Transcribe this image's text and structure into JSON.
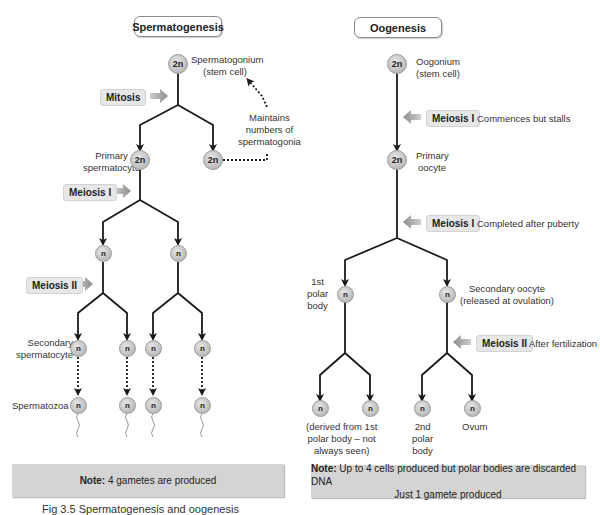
{
  "spermatogenesis": {
    "title": "Spermatogenesis",
    "stem_cell": {
      "ploidy": "2n",
      "label_line1": "Spermatogonium",
      "label_line2": "(stem cell)"
    },
    "mitosis_label": "Mitosis",
    "primary": {
      "ploidy": "2n",
      "label_line1": "Primary",
      "label_line2": "spermatocyte"
    },
    "renewed_stem_cell": {
      "ploidy": "2n"
    },
    "maintains_note": {
      "line1": "Maintains",
      "line2": "numbers of",
      "line3": "spermatogonia"
    },
    "meiosis1_label": "Meiosis I",
    "after_meiosis1": [
      "n",
      "n"
    ],
    "meiosis2_label": "Meiosis II",
    "secondary": {
      "label_line1": "Secondary",
      "label_line2": "spermatocyte",
      "cells": [
        "n",
        "n",
        "n",
        "n"
      ]
    },
    "spermatozoa": {
      "label": "Spermatozoa",
      "cells": [
        "n",
        "n",
        "n",
        "n"
      ]
    },
    "note": {
      "prefix": "Note:",
      "text": " 4 gametes are produced"
    }
  },
  "oogenesis": {
    "title": "Oogenesis",
    "stem_cell": {
      "ploidy": "2n",
      "label_line1": "Oogonium",
      "label_line2": "(stem cell)"
    },
    "meiosis1_stall": {
      "label": "Meiosis I",
      "desc": "Commences but stalls"
    },
    "primary": {
      "ploidy": "2n",
      "label_line1": "Primary",
      "label_line2": "oocyte"
    },
    "meiosis1_complete": {
      "label": "Meiosis I",
      "desc": "Completed after puberty"
    },
    "first_polar_body": {
      "ploidy": "n",
      "label_line1": "1st",
      "label_line2": "polar",
      "label_line3": "body"
    },
    "secondary_oocyte": {
      "ploidy": "n",
      "label_line1": "Secondary oocyte",
      "label_line2": "(released at ovulation)"
    },
    "meiosis2": {
      "label": "Meiosis II",
      "desc": "After fertilization"
    },
    "final_cells": [
      "n",
      "n",
      "n",
      "n"
    ],
    "derived_note": {
      "line1": "(derived from 1st",
      "line2": "polar body – not",
      "line3": "always seen)"
    },
    "second_polar_body": {
      "line1": "2nd",
      "line2": "polar",
      "line3": "body"
    },
    "ovum_label": "Ovum",
    "note": {
      "prefix": "Note:",
      "text": " Up to 4 cells produced but polar bodies are discarded DNA",
      "line2": "Just 1 gamete produced"
    }
  },
  "caption": "Fig 3.5 Spermatogenesis and oogenesis"
}
